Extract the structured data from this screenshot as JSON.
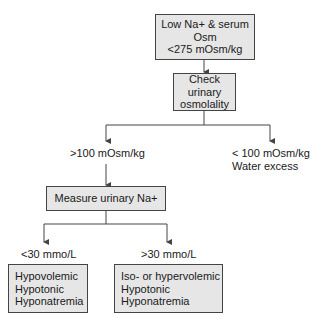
{
  "nodes": {
    "start": {
      "line1": "Low Na+ & serum Osm",
      "line2": "<275 mOsm/kg"
    },
    "check_urine_osm": {
      "line1": "Check urinary",
      "line2": "osmolality"
    },
    "high_osm": {
      "label": ">100 mOsm/kg"
    },
    "low_osm": {
      "line1": "< 100 mOsm/kg",
      "line2": "Water excess"
    },
    "measure_na": {
      "label": "Measure urinary Na+"
    },
    "low_na": {
      "label": "<30 mmo/L"
    },
    "high_na": {
      "label": ">30 mmo/L"
    },
    "hypovolemic": {
      "line1": "Hypovolemic",
      "line2": "Hypotonic",
      "line3": "Hyponatremia"
    },
    "isohyper": {
      "line1": "Iso- or hypervolemic",
      "line2": "Hypotonic",
      "line3": "Hyponatremia"
    }
  },
  "edges": [
    {
      "from": "start",
      "to": "check_urine_osm"
    },
    {
      "from": "check_urine_osm",
      "to": "high_osm"
    },
    {
      "from": "check_urine_osm",
      "to": "low_osm"
    },
    {
      "from": "high_osm",
      "to": "measure_na"
    },
    {
      "from": "measure_na",
      "to": "low_na"
    },
    {
      "from": "measure_na",
      "to": "high_na"
    },
    {
      "from": "low_na",
      "to": "hypovolemic"
    },
    {
      "from": "high_na",
      "to": "isohyper"
    }
  ],
  "colors": {
    "box_fill": "#e6e6e6",
    "line": "#444444"
  }
}
